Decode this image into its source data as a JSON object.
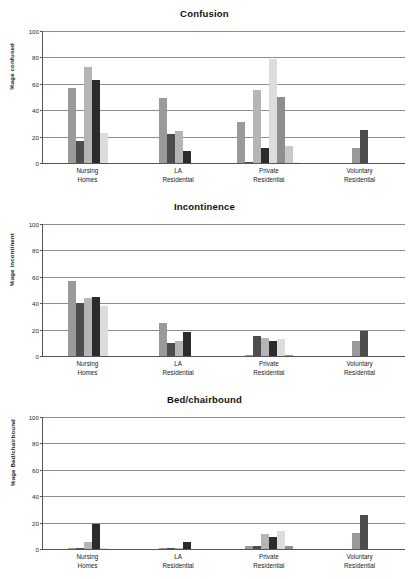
{
  "chart_data": [
    {
      "type": "bar",
      "title": "Confusion",
      "xlabel": "",
      "ylabel": "%age confused",
      "ylim": [
        0,
        100
      ],
      "yticks": [
        0,
        20,
        40,
        60,
        80,
        100
      ],
      "grid": true,
      "legend": "none",
      "categories": [
        "Nursing Homes",
        "LA Residential",
        "Private Residential",
        "Voluntary Residential"
      ],
      "groups": [
        {
          "category": "Nursing Homes",
          "values": [
            57,
            17,
            73,
            63,
            23
          ]
        },
        {
          "category": "LA Residential",
          "values": [
            49,
            22,
            24,
            9,
            0
          ]
        },
        {
          "category": "Private Residential",
          "values": [
            31,
            1,
            55,
            11,
            79,
            50,
            13,
            1
          ]
        },
        {
          "category": "Voluntary Residential",
          "values": [
            11,
            25
          ]
        }
      ]
    },
    {
      "type": "bar",
      "title": "Incontinence",
      "xlabel": "",
      "ylabel": "%age incontinent",
      "ylim": [
        0,
        100
      ],
      "yticks": [
        0,
        20,
        40,
        60,
        80,
        100
      ],
      "grid": true,
      "legend": "none",
      "categories": [
        "Nursing Homes",
        "LA Residential",
        "Private Residential",
        "Voluntary Residential"
      ],
      "groups": [
        {
          "category": "Nursing Homes",
          "values": [
            57,
            40,
            44,
            45,
            38
          ]
        },
        {
          "category": "LA Residential",
          "values": [
            25,
            10,
            11,
            18,
            0
          ]
        },
        {
          "category": "Private Residential",
          "values": [
            1,
            15,
            14,
            11,
            13,
            1
          ]
        },
        {
          "category": "Voluntary Residential",
          "values": [
            11,
            19
          ]
        }
      ]
    },
    {
      "type": "bar",
      "title": "Bed/chairbound",
      "xlabel": "",
      "ylabel": "%age Bed/chairbound",
      "ylim": [
        0,
        100
      ],
      "yticks": [
        0,
        20,
        40,
        60,
        80,
        100
      ],
      "grid": true,
      "legend": "none",
      "categories": [
        "Nursing Homes",
        "LA Residential",
        "Private Residential",
        "Voluntary Residential"
      ],
      "groups": [
        {
          "category": "Nursing Homes",
          "values": [
            1,
            1,
            5,
            19,
            1
          ]
        },
        {
          "category": "LA Residential",
          "values": [
            1,
            1,
            1,
            5,
            0
          ]
        },
        {
          "category": "Private Residential",
          "values": [
            2,
            2,
            11,
            9,
            14,
            2
          ]
        },
        {
          "category": "Voluntary Residential",
          "values": [
            12,
            26
          ]
        }
      ]
    }
  ],
  "series_colors": [
    "#9a9a9a",
    "#4d4d4d",
    "#b5b5b5",
    "#2b2b2b",
    "#dcdcdc",
    "#8e8e8e",
    "#c8c8c8",
    "#efefef"
  ],
  "axis": {
    "tick_labels": [
      "0",
      "20",
      "40",
      "60",
      "80",
      "100"
    ]
  },
  "xcategories": [
    {
      "line1": "Nursing",
      "line2": "Homes"
    },
    {
      "line1": "LA",
      "line2": "Residential"
    },
    {
      "line1": "Private",
      "line2": "Residential"
    },
    {
      "line1": "Voluntary",
      "line2": "Residential"
    }
  ],
  "panels": [
    {
      "title": "Confusion",
      "ylabel": "%age confused"
    },
    {
      "title": "Incontinence",
      "ylabel": "%age incontinent"
    },
    {
      "title": "Bed/chairbound",
      "ylabel": "%age Bed/chairbound"
    }
  ]
}
